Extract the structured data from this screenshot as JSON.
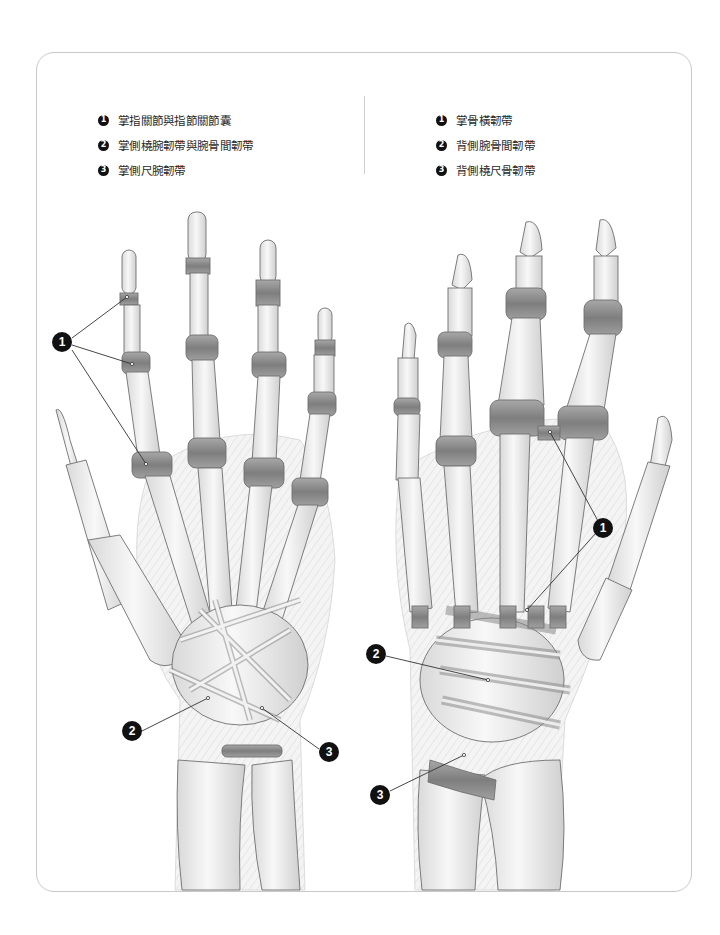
{
  "figure": {
    "title": "",
    "left_panel": {
      "view": "palmar",
      "legend": [
        {
          "num": "1",
          "label": "掌指關節與指節關節囊"
        },
        {
          "num": "2",
          "label": "掌側橈腕韌帶與腕骨間韌帶"
        },
        {
          "num": "3",
          "label": "掌側尺腕韌帶"
        }
      ],
      "callouts": [
        {
          "num": "1",
          "x": 62,
          "y": 342
        },
        {
          "num": "2",
          "x": 132,
          "y": 731
        },
        {
          "num": "3",
          "x": 329,
          "y": 752
        }
      ]
    },
    "right_panel": {
      "view": "dorsal",
      "legend": [
        {
          "num": "1",
          "label": "掌骨橫韌帶"
        },
        {
          "num": "2",
          "label": "背側腕骨間韌帶"
        },
        {
          "num": "3",
          "label": "背側橈尺骨韌帶"
        }
      ],
      "callouts": [
        {
          "num": "1",
          "x": 603,
          "y": 528
        },
        {
          "num": "2",
          "x": 376,
          "y": 654
        },
        {
          "num": "3",
          "x": 380,
          "y": 795
        }
      ]
    }
  },
  "colors": {
    "frame_border": "#c9c9c9",
    "bone": "#f2f2f2",
    "bone_outline": "#6f6f6f",
    "ligament": "#9a9a9a",
    "callout": "#111111"
  }
}
